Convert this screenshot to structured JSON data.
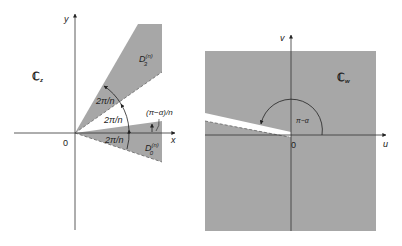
{
  "colors": {
    "region_fill": "#a7a7a7",
    "axis": "#333333",
    "background": "#ffffff",
    "slit": "#ffffff"
  },
  "left_panel": {
    "plane_label": "ℂ",
    "plane_sub": "z",
    "x_axis_label": "x",
    "y_axis_label": "y",
    "origin_label": "0",
    "upper_sector_label": "D",
    "upper_sector_sup": "(n)",
    "upper_sector_sub": "3",
    "lower_sector_label": "D",
    "lower_sector_sup": "(n)",
    "lower_sector_sub": "0",
    "angle_labels": [
      "2π/n",
      "2π/n",
      "2π/n"
    ],
    "small_angle_label": "(π−α)/n"
  },
  "right_panel": {
    "plane_label": "ℂ",
    "plane_sub": "w",
    "u_axis_label": "u",
    "v_axis_label": "v",
    "origin_label": "0",
    "angle_label": "π−α"
  }
}
